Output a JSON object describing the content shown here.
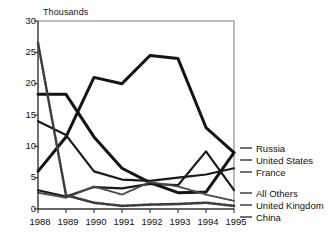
{
  "chart_data": {
    "type": "line",
    "title": "",
    "subtitle": "",
    "unit_label": "Thousands",
    "xlabel": "",
    "ylabel": "",
    "categories": [
      "1988",
      "1989",
      "1990",
      "1991",
      "1992",
      "1993",
      "1994",
      "1995"
    ],
    "x": [
      1988,
      1989,
      1990,
      1991,
      1992,
      1993,
      1994,
      1995
    ],
    "xlim": [
      1988,
      1995
    ],
    "ylim": [
      0,
      30
    ],
    "yticks": [
      0,
      5,
      10,
      15,
      20,
      25,
      30
    ],
    "ytick_labels": [
      "0",
      "5",
      "10",
      "15",
      "20",
      "25",
      "30"
    ],
    "grid": false,
    "legend_position": "right",
    "series": [
      {
        "name": "Russia",
        "values": [
          6.0,
          11.5,
          21.0,
          20.0,
          24.5,
          24.0,
          13.0,
          9.0
        ],
        "style": "thick-solid"
      },
      {
        "name": "United States",
        "values": [
          18.3,
          18.3,
          11.5,
          6.5,
          4.2,
          2.6,
          2.7,
          9.0
        ],
        "style": "thick-solid"
      },
      {
        "name": "France",
        "values": [
          14.0,
          11.8,
          6.0,
          4.7,
          4.5,
          5.0,
          5.5,
          6.5
        ],
        "style": "medium-solid"
      },
      {
        "name": "All Others",
        "values": [
          3.0,
          2.0,
          3.5,
          3.3,
          4.0,
          3.8,
          9.2,
          3.0
        ],
        "style": "medium-solid"
      },
      {
        "name": "United Kingdom",
        "values": [
          2.6,
          1.8,
          3.6,
          2.3,
          4.3,
          3.6,
          2.3,
          1.3
        ],
        "style": "dotted"
      },
      {
        "name": "China",
        "values": [
          26.5,
          2.2,
          1.0,
          0.5,
          0.7,
          0.8,
          1.0,
          0.5
        ],
        "style": "dotted-thick"
      }
    ]
  },
  "axis": {
    "ytick_0": "0",
    "ytick_1": "5",
    "ytick_2": "10",
    "ytick_3": "15",
    "ytick_4": "20",
    "ytick_5": "25",
    "ytick_6": "30",
    "xtick_0": "1988",
    "xtick_1": "1989",
    "xtick_2": "1990",
    "xtick_3": "1991",
    "xtick_4": "1992",
    "xtick_5": "1993",
    "xtick_6": "1994",
    "xtick_7": "1995"
  },
  "legend": {
    "items": [
      {
        "label": "Russia"
      },
      {
        "label": "United States"
      },
      {
        "label": "France"
      },
      {
        "label": "All Others"
      },
      {
        "label": "United Kingdom"
      },
      {
        "label": "China"
      }
    ]
  },
  "colors": {
    "ink": "#111111",
    "axis": "#555555",
    "background": "#ffffff"
  }
}
